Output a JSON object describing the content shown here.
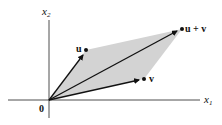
{
  "diagram": {
    "colors": {
      "shading": "#d3d3d3",
      "axis": "#222222",
      "vector": "#111111",
      "background": "#ffffff"
    },
    "axes": {
      "x_label": "x",
      "x_sub": "1",
      "y_label": "x",
      "y_sub": "2",
      "origin_label": "0"
    },
    "points": {
      "u": {
        "label": "u"
      },
      "v": {
        "label": "v"
      },
      "sum": {
        "label": "u + v"
      }
    }
  }
}
